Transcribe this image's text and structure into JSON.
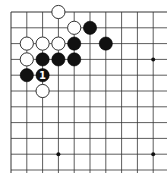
{
  "board": {
    "origin_x": 11,
    "origin_y": 12,
    "spacing": 15.8,
    "cols": 11,
    "rows": 11,
    "line_color": "#333333",
    "background": "#ffffff",
    "star_points": [
      [
        9,
        3
      ],
      [
        3,
        9
      ],
      [
        9,
        9
      ]
    ],
    "stones": [
      {
        "color": "white",
        "col": 3,
        "row": 0,
        "label": ""
      },
      {
        "color": "white",
        "col": 4,
        "row": 1,
        "label": ""
      },
      {
        "color": "black",
        "col": 5,
        "row": 1,
        "label": ""
      },
      {
        "color": "white",
        "col": 1,
        "row": 2,
        "label": ""
      },
      {
        "color": "white",
        "col": 2,
        "row": 2,
        "label": ""
      },
      {
        "color": "white",
        "col": 3,
        "row": 2,
        "label": ""
      },
      {
        "color": "black",
        "col": 4,
        "row": 2,
        "label": ""
      },
      {
        "color": "black",
        "col": 6,
        "row": 2,
        "label": ""
      },
      {
        "color": "white",
        "col": 1,
        "row": 3,
        "label": ""
      },
      {
        "color": "black",
        "col": 2,
        "row": 3,
        "label": ""
      },
      {
        "color": "black",
        "col": 3,
        "row": 3,
        "label": ""
      },
      {
        "color": "black",
        "col": 4,
        "row": 3,
        "label": ""
      },
      {
        "color": "black",
        "col": 1,
        "row": 4,
        "label": ""
      },
      {
        "color": "black",
        "col": 2,
        "row": 4,
        "label": "1"
      },
      {
        "color": "white",
        "col": 2,
        "row": 5,
        "label": ""
      }
    ]
  }
}
